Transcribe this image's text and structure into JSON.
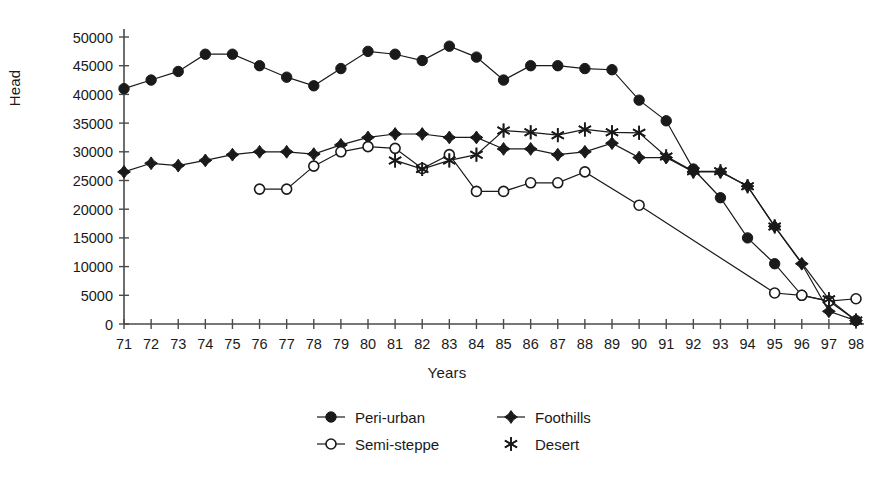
{
  "chart_data": {
    "type": "line",
    "title": "",
    "xlabel": "Years",
    "ylabel": "Head",
    "xlim": [
      71,
      98
    ],
    "ylim": [
      0,
      50000
    ],
    "grid": false,
    "legend_position": "bottom",
    "y_ticks": [
      0,
      5000,
      10000,
      15000,
      20000,
      25000,
      30000,
      35000,
      40000,
      45000,
      50000
    ],
    "y_tick_labels": [
      "0",
      "5000",
      "10000",
      "15000",
      "20000",
      "25000",
      "30000",
      "35000",
      "40000",
      "45000",
      "50000"
    ],
    "x_ticks": [
      71,
      72,
      73,
      74,
      75,
      76,
      77,
      78,
      79,
      80,
      81,
      82,
      83,
      84,
      85,
      86,
      87,
      88,
      89,
      90,
      91,
      92,
      93,
      94,
      95,
      96,
      97,
      98
    ],
    "x_tick_labels": [
      "71",
      "72",
      "73",
      "74",
      "75",
      "76",
      "77",
      "78",
      "79",
      "80",
      "81",
      "82",
      "83",
      "84",
      "85",
      "86",
      "87",
      "88",
      "89",
      "90",
      "91",
      "92",
      "93",
      "94",
      "95",
      "96",
      "97",
      "98"
    ],
    "categories": [
      71,
      72,
      73,
      74,
      75,
      76,
      77,
      78,
      79,
      80,
      81,
      82,
      83,
      84,
      85,
      86,
      87,
      88,
      89,
      90,
      91,
      92,
      93,
      94,
      95,
      96,
      97,
      98
    ],
    "series": [
      {
        "name": "Peri-urban",
        "marker": "filled-circle",
        "color": "#1a1a1a",
        "x": [
          71,
          72,
          73,
          74,
          75,
          76,
          77,
          78,
          79,
          80,
          81,
          82,
          83,
          84,
          85,
          86,
          87,
          88,
          89,
          90,
          91,
          92,
          93,
          94,
          95,
          96,
          97,
          98
        ],
        "values": [
          41000,
          42500,
          44000,
          47000,
          47000,
          45000,
          43000,
          41500,
          44500,
          47500,
          47000,
          45900,
          48400,
          46500,
          42500,
          45000,
          45000,
          44500,
          44300,
          39000,
          35400,
          27000,
          22000,
          15000,
          10500,
          5000,
          4000,
          600
        ]
      },
      {
        "name": "Foothills",
        "marker": "filled-diamond",
        "color": "#1a1a1a",
        "x": [
          71,
          72,
          73,
          74,
          75,
          76,
          77,
          78,
          79,
          80,
          81,
          82,
          83,
          84,
          85,
          86,
          87,
          88,
          89,
          90,
          91,
          92,
          93,
          94,
          95,
          96,
          97,
          98
        ],
        "values": [
          26500,
          28000,
          27600,
          28500,
          29500,
          30000,
          30000,
          29600,
          31200,
          32500,
          33100,
          33100,
          32500,
          32500,
          30500,
          30500,
          29500,
          30000,
          31500,
          29000,
          29000,
          26500,
          26500,
          24000,
          17000,
          10500,
          2200,
          600
        ]
      },
      {
        "name": "Semi-steppe",
        "marker": "open-circle",
        "color": "#1a1a1a",
        "x": [
          76,
          77,
          78,
          79,
          80,
          81,
          82,
          83,
          84,
          85,
          86,
          87,
          88,
          90,
          95,
          96,
          97,
          98
        ],
        "values": [
          23500,
          23500,
          27500,
          30000,
          30900,
          30600,
          27100,
          29500,
          23100,
          23100,
          24600,
          24600,
          26500,
          20700,
          5400,
          5000,
          4000,
          4400
        ]
      },
      {
        "name": "Desert",
        "marker": "star",
        "color": "#1a1a1a",
        "x": [
          81,
          82,
          83,
          84,
          85,
          86,
          87,
          88,
          89,
          90,
          91,
          92,
          93,
          94,
          95,
          97,
          98
        ],
        "values": [
          28500,
          27000,
          28500,
          29500,
          33700,
          33400,
          32900,
          33900,
          33400,
          33300,
          29200,
          26600,
          26600,
          24000,
          17000,
          4300,
          600
        ]
      }
    ],
    "legend_entries": [
      {
        "label": "Peri-urban",
        "marker": "filled-circle"
      },
      {
        "label": "Foothills",
        "marker": "filled-diamond"
      },
      {
        "label": "Semi-steppe",
        "marker": "open-circle"
      },
      {
        "label": "Desert",
        "marker": "star"
      }
    ]
  }
}
